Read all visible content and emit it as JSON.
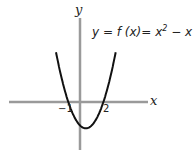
{
  "chart_data": {
    "type": "line",
    "equation": {
      "lhs": "y = f (x)= ",
      "x": "x",
      "exp": "2",
      "rest": " − x − 2"
    },
    "xlabel": "x",
    "ylabel": "y",
    "tick_labels": {
      "neg": "−1",
      "pos": "2"
    },
    "roots": [
      -1,
      2
    ],
    "vertex": [
      0.5,
      -2.25
    ],
    "x": [
      -2.0,
      -1.5,
      -1.0,
      -0.5,
      0.0,
      0.5,
      1.0,
      1.5,
      2.0,
      2.5,
      3.0
    ],
    "values": [
      4.0,
      1.75,
      0.0,
      -1.25,
      -2.0,
      -2.25,
      -2.0,
      -1.25,
      0.0,
      1.75,
      4.0
    ],
    "xlim": [
      -6.1,
      5.8
    ],
    "ylim": [
      -4.1,
      7.2
    ],
    "grid": false,
    "colors": {
      "axis": "#9a9a9a",
      "curve": "#111111"
    }
  }
}
